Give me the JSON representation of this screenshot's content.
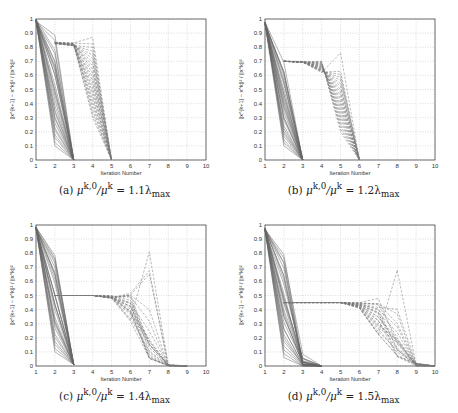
{
  "chart_data": [
    {
      "id": "a",
      "type": "line",
      "caption": "(a) μ^{k,0}/μ^k = 1.1λ_max",
      "caption_parts": {
        "label": "(a)",
        "lhs": "μ",
        "sup1": "k,0",
        "slash": "/μ",
        "sup2": "k",
        "eq": " = 1.1λ",
        "sub": "max"
      },
      "xlabel": "Iteration Number",
      "ylabel": "||x^{k+1} − x^k||² / ||x^k||²",
      "xlim": [
        1,
        10
      ],
      "ylim": [
        0,
        1
      ],
      "xticks": [
        1,
        2,
        3,
        4,
        5,
        6,
        7,
        8,
        9,
        10
      ],
      "yticks": [
        0,
        0.1,
        0.2,
        0.3,
        0.4,
        0.5,
        0.6,
        0.7,
        0.8,
        0.9,
        1
      ],
      "grid": true,
      "solid_group": {
        "style": "solid",
        "x": [
          1,
          2,
          3
        ],
        "start": 1.0,
        "mid_range": [
          0.1,
          0.9
        ],
        "end": 0.0,
        "count": 28
      },
      "dashed_group": {
        "style": "dashed",
        "x": [
          1,
          2,
          3,
          4,
          5
        ],
        "plateau": 0.83,
        "peak_max": 0.87,
        "mid4_range": [
          0.3,
          0.85
        ],
        "end": 0.0,
        "count": 22,
        "start_x": 2
      }
    },
    {
      "id": "b",
      "type": "line",
      "caption": "(b) μ^{k,0}/μ^k = 1.2λ_max",
      "caption_parts": {
        "label": "(b)",
        "lhs": "μ",
        "sup1": "k,0",
        "slash": "/μ",
        "sup2": "k",
        "eq": " = 1.2λ",
        "sub": "max"
      },
      "xlabel": "Iteration Number",
      "ylabel": "||x^{k+1} − x^k||² / ||x^k||²",
      "xlim": [
        1,
        10
      ],
      "ylim": [
        0,
        1
      ],
      "xticks": [
        1,
        2,
        3,
        4,
        5,
        6,
        7,
        8,
        9,
        10
      ],
      "yticks": [
        0,
        0.1,
        0.2,
        0.3,
        0.4,
        0.5,
        0.6,
        0.7,
        0.8,
        0.9,
        1
      ],
      "grid": true,
      "solid_group": {
        "style": "solid",
        "x": [
          1,
          2,
          3
        ],
        "start": 0.98,
        "mid_range": [
          0.1,
          0.73
        ],
        "end": 0.0,
        "count": 28
      },
      "dashed_group": {
        "style": "dashed",
        "x": [
          2,
          3,
          4,
          5,
          6
        ],
        "plateau": 0.7,
        "peak_max": 0.76,
        "mid5_range": [
          0.2,
          0.65
        ],
        "end": 0.0,
        "count": 22
      }
    },
    {
      "id": "c",
      "type": "line",
      "caption": "(c) μ^{k,0}/μ^k = 1.4λ_max",
      "caption_parts": {
        "label": "(c)",
        "lhs": "μ",
        "sup1": "k,0",
        "slash": "/μ",
        "sup2": "k",
        "eq": " = 1.4λ",
        "sub": "max"
      },
      "xlabel": "Iteration Number",
      "ylabel": "||x^{k+1} − x^k||² / ||x^k||²",
      "xlim": [
        1,
        10
      ],
      "ylim": [
        0,
        1
      ],
      "xticks": [
        1,
        2,
        3,
        4,
        5,
        6,
        7,
        8,
        9,
        10
      ],
      "yticks": [
        0,
        0.1,
        0.2,
        0.3,
        0.4,
        0.5,
        0.6,
        0.7,
        0.8,
        0.9,
        1
      ],
      "grid": true,
      "solid_group": {
        "style": "solid",
        "x": [
          1,
          2,
          3
        ],
        "start": 0.99,
        "mid_range": [
          0.1,
          0.86
        ],
        "end": 0.01,
        "count": 28
      },
      "dashed_group": {
        "style": "dashed",
        "x": [
          2,
          3,
          4,
          5,
          6,
          7,
          8,
          9
        ],
        "plateau": 0.5,
        "peak_max": 0.81,
        "end": 0.0,
        "count": 22
      }
    },
    {
      "id": "d",
      "type": "line",
      "caption": "(d) μ^{k,0}/μ^k = 1.5λ_max",
      "caption_parts": {
        "label": "(d)",
        "lhs": "μ",
        "sup1": "k,0",
        "slash": "/μ",
        "sup2": "k",
        "eq": " = 1.5λ",
        "sub": "max"
      },
      "xlabel": "Iteration Number",
      "ylabel": "||x^{k+1} − x^k||² / ||x^k||²",
      "xlim": [
        1,
        10
      ],
      "ylim": [
        0,
        1
      ],
      "xticks": [
        1,
        2,
        3,
        4,
        5,
        6,
        7,
        8,
        9,
        10
      ],
      "yticks": [
        0,
        0.1,
        0.2,
        0.3,
        0.4,
        0.5,
        0.6,
        0.7,
        0.8,
        0.9,
        1
      ],
      "grid": true,
      "solid_group": {
        "style": "solid",
        "x": [
          1,
          2,
          3,
          4
        ],
        "start": 0.98,
        "mid_range": [
          0.06,
          0.85
        ],
        "end": 0.0,
        "count": 28
      },
      "dashed_group": {
        "style": "dashed",
        "x": [
          2,
          3,
          4,
          5,
          6,
          7,
          8,
          9,
          10
        ],
        "plateau": 0.45,
        "peak_max": 0.68,
        "end": 0.0,
        "count": 22
      }
    }
  ],
  "colors": {
    "line": "#666666",
    "dashed": "#777777",
    "grid": "#bbbbbb",
    "axis": "#333333"
  }
}
